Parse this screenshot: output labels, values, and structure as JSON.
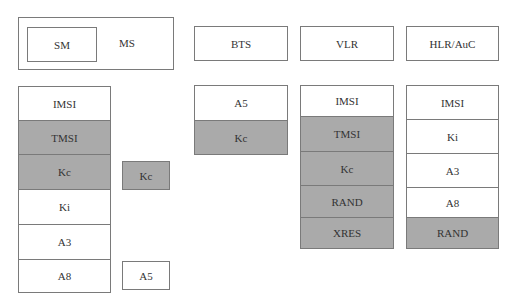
{
  "colors": {
    "shaded": "#aaaaaa",
    "border": "#7a7a7a",
    "background": "#ffffff"
  },
  "ms": {
    "outer_label": "MS",
    "inner_label": "SM"
  },
  "headers": {
    "bts": "BTS",
    "vlr": "VLR",
    "hlr": "HLR/AuC"
  },
  "columns": {
    "ms": [
      {
        "label": "IMSI",
        "shaded": false
      },
      {
        "label": "TMSI",
        "shaded": true
      },
      {
        "label": "Kc",
        "shaded": true
      },
      {
        "label": "Ki",
        "shaded": false
      },
      {
        "label": "A3",
        "shaded": false
      },
      {
        "label": "A8",
        "shaded": false
      }
    ],
    "bts": [
      {
        "label": "A5",
        "shaded": false
      },
      {
        "label": "Kc",
        "shaded": true
      }
    ],
    "vlr": [
      {
        "label": "IMSI",
        "shaded": false
      },
      {
        "label": "TMSI",
        "shaded": true
      },
      {
        "label": "Kc",
        "shaded": true
      },
      {
        "label": "RAND",
        "shaded": true
      },
      {
        "label": "XRES",
        "shaded": true
      }
    ],
    "hlr": [
      {
        "label": "IMSI",
        "shaded": false
      },
      {
        "label": "Ki",
        "shaded": false
      },
      {
        "label": "A3",
        "shaded": false
      },
      {
        "label": "A8",
        "shaded": false
      },
      {
        "label": "RAND",
        "shaded": true
      }
    ]
  },
  "side_boxes": {
    "kc": {
      "label": "Kc",
      "shaded": true
    },
    "a5": {
      "label": "A5",
      "shaded": false
    }
  }
}
